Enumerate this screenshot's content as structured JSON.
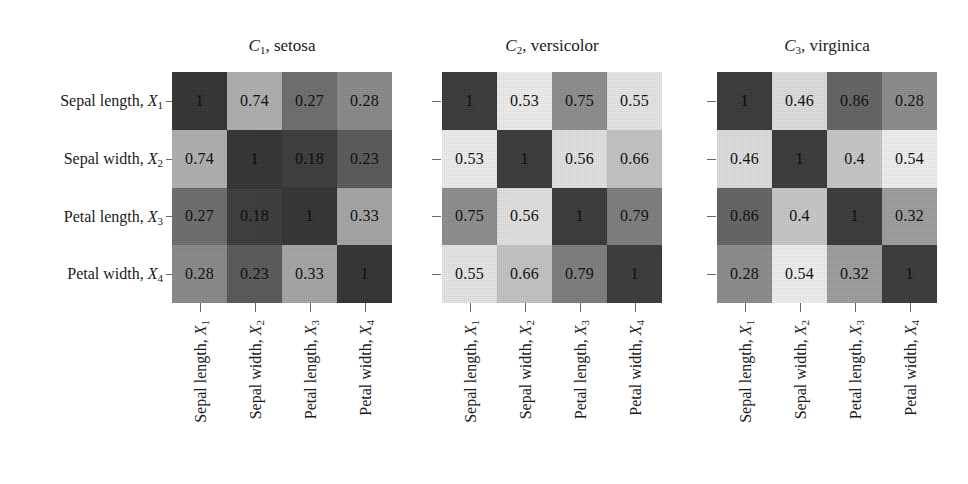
{
  "figure": {
    "type": "correlation-heatmap-grid",
    "variables": [
      {
        "name": "Sepal length",
        "symbol": "X",
        "index": "1"
      },
      {
        "name": "Sepal width",
        "symbol": "X",
        "index": "2"
      },
      {
        "name": "Petal length",
        "symbol": "X",
        "index": "3"
      },
      {
        "name": "Petal width",
        "symbol": "X",
        "index": "4"
      }
    ]
  },
  "chart_data": {
    "type": "heatmap",
    "title": "",
    "xlabel": "",
    "ylabel": "",
    "grid": false,
    "legend": "none",
    "colorscale": "grayscale, darker = higher magnitude (per-panel)",
    "categories": [
      "Sepal length, X1",
      "Sepal width, X2",
      "Petal length, X3",
      "Petal width, X4"
    ],
    "panels": [
      {
        "id": "C1",
        "class_symbol": "C",
        "class_index": "1",
        "class_name": "setosa",
        "title": "C1, setosa",
        "matrix": [
          [
            "1",
            "0.74",
            "0.27",
            "0.28"
          ],
          [
            "0.74",
            "1",
            "0.18",
            "0.23"
          ],
          [
            "0.27",
            "0.18",
            "1",
            "0.33"
          ],
          [
            "0.28",
            "0.23",
            "0.33",
            "1"
          ]
        ],
        "values": [
          [
            1,
            0.74,
            0.27,
            0.28
          ],
          [
            0.74,
            1,
            0.18,
            0.23
          ],
          [
            0.27,
            0.18,
            1,
            0.33
          ],
          [
            0.28,
            0.23,
            0.33,
            1
          ]
        ],
        "cell_colors": [
          [
            "#343434",
            "#b0b0b0",
            "#6e6e6e",
            "#8a8a8a"
          ],
          [
            "#b0b0b0",
            "#343434",
            "#3c3c3c",
            "#5a5a5a"
          ],
          [
            "#6e6e6e",
            "#3c3c3c",
            "#343434",
            "#a6a6a6"
          ],
          [
            "#8a8a8a",
            "#5a5a5a",
            "#a6a6a6",
            "#343434"
          ]
        ]
      },
      {
        "id": "C2",
        "class_symbol": "C",
        "class_index": "2",
        "class_name": "versicolor",
        "title": "C2, versicolor",
        "matrix": [
          [
            "1",
            "0.53",
            "0.75",
            "0.55"
          ],
          [
            "0.53",
            "1",
            "0.56",
            "0.66"
          ],
          [
            "0.75",
            "0.56",
            "1",
            "0.79"
          ],
          [
            "0.55",
            "0.66",
            "0.79",
            "1"
          ]
        ],
        "values": [
          [
            1,
            0.53,
            0.75,
            0.55
          ],
          [
            0.53,
            1,
            0.56,
            0.66
          ],
          [
            0.75,
            0.56,
            1,
            0.79
          ],
          [
            0.55,
            0.66,
            0.79,
            1
          ]
        ],
        "cell_colors": [
          [
            "#3a3a3a",
            "#eeeeee",
            "#8e8e8e",
            "#e6e6e6"
          ],
          [
            "#eeeeee",
            "#3a3a3a",
            "#e2e2e2",
            "#c4c4c4"
          ],
          [
            "#8e8e8e",
            "#e2e2e2",
            "#3a3a3a",
            "#7e7e7e"
          ],
          [
            "#e6e6e6",
            "#c4c4c4",
            "#7e7e7e",
            "#3a3a3a"
          ]
        ]
      },
      {
        "id": "C3",
        "class_symbol": "C",
        "class_index": "3",
        "class_name": "virginica",
        "title": "C3, virginica",
        "matrix": [
          [
            "1",
            "0.46",
            "0.86",
            "0.28"
          ],
          [
            "0.46",
            "1",
            "0.4",
            "0.54"
          ],
          [
            "0.86",
            "0.4",
            "1",
            "0.32"
          ],
          [
            "0.28",
            "0.54",
            "0.32",
            "1"
          ]
        ],
        "values": [
          [
            1,
            0.46,
            0.86,
            0.28
          ],
          [
            0.46,
            1,
            0.4,
            0.54
          ],
          [
            0.86,
            0.4,
            1,
            0.32
          ],
          [
            0.28,
            0.54,
            0.32,
            1
          ]
        ],
        "cell_colors": [
          [
            "#3a3a3a",
            "#dedede",
            "#646464",
            "#8c8c8c"
          ],
          [
            "#dedede",
            "#3a3a3a",
            "#c8c8c8",
            "#f0f0f0"
          ],
          [
            "#646464",
            "#c8c8c8",
            "#3a3a3a",
            "#9e9e9e"
          ],
          [
            "#8c8c8c",
            "#f0f0f0",
            "#9e9e9e",
            "#3a3a3a"
          ]
        ]
      }
    ]
  }
}
